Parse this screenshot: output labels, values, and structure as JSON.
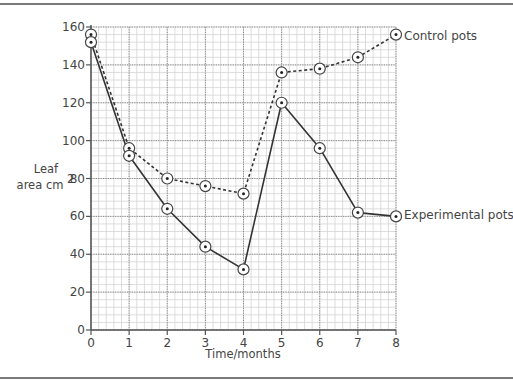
{
  "chart_data": {
    "type": "line",
    "title": "",
    "xlabel": "Time/months",
    "ylabel_line1": "Leaf",
    "ylabel_line2": "area cm",
    "ylabel_sup": "2",
    "x": [
      0,
      1,
      2,
      3,
      4,
      5,
      6,
      7,
      8
    ],
    "x_ticks": [
      "0",
      "1",
      "2",
      "3",
      "4",
      "5",
      "6",
      "7",
      "8"
    ],
    "y_ticks": [
      "0",
      "20",
      "40",
      "60",
      "80",
      "100",
      "120",
      "140",
      "160"
    ],
    "xlim": [
      0,
      8
    ],
    "ylim": [
      0,
      160
    ],
    "grid": true,
    "series": [
      {
        "name": "Control pots",
        "line_style": "dashed",
        "values": [
          156,
          96,
          80,
          76,
          72,
          136,
          138,
          144,
          156
        ]
      },
      {
        "name": "Experimental pots",
        "line_style": "solid",
        "values": [
          152,
          92,
          64,
          44,
          32,
          120,
          96,
          62,
          60
        ]
      }
    ],
    "legend_position": "inline-right"
  }
}
